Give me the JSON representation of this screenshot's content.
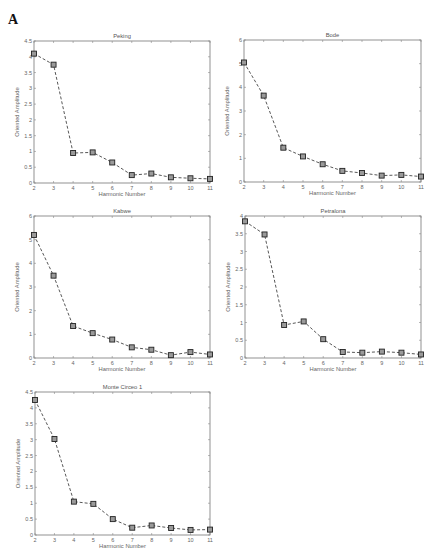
{
  "panel_label": "A",
  "chart_data": [
    {
      "type": "line",
      "title": "Peking",
      "xlabel": "Harmonic Number",
      "ylabel": "Oriented Amplitude",
      "x": [
        2,
        3,
        4,
        5,
        6,
        7,
        8,
        9,
        10,
        11
      ],
      "values": [
        4.1,
        3.75,
        0.95,
        0.97,
        0.65,
        0.25,
        0.3,
        0.18,
        0.15,
        0.13
      ],
      "ylim": [
        0,
        4.5
      ],
      "yticks": [
        0,
        0.5,
        1,
        1.5,
        2,
        2.5,
        3,
        3.5,
        4,
        4.5
      ],
      "ytick_labels": [
        "0",
        "0.5",
        "1",
        "1.5",
        "2",
        "2.5",
        "3",
        "3.5",
        "4",
        "4.5"
      ],
      "xlim": [
        2,
        11
      ],
      "grid": false,
      "box": {
        "left": 34,
        "top": 41,
        "width": 176,
        "height": 142
      }
    },
    {
      "type": "line",
      "title": "Bode",
      "xlabel": "Harmonic Number",
      "ylabel": "Oriented Amplitude",
      "x": [
        2,
        3,
        4,
        5,
        6,
        7,
        8,
        9,
        10,
        11
      ],
      "values": [
        5.05,
        3.65,
        1.45,
        1.08,
        0.75,
        0.47,
        0.38,
        0.27,
        0.3,
        0.23
      ],
      "ylim": [
        0,
        6
      ],
      "yticks": [
        0,
        1,
        2,
        3,
        4,
        5,
        6
      ],
      "ytick_labels": [
        "0",
        "1",
        "2",
        "3",
        "4",
        "5",
        "6"
      ],
      "xlim": [
        2,
        11
      ],
      "grid": false,
      "box": {
        "left": 244,
        "top": 40,
        "width": 177,
        "height": 142
      }
    },
    {
      "type": "line",
      "title": "Kabwe",
      "xlabel": "Harmonic Number",
      "ylabel": "Oriented Amplitude",
      "x": [
        2,
        3,
        4,
        5,
        6,
        7,
        8,
        9,
        10,
        11
      ],
      "values": [
        5.2,
        3.48,
        1.35,
        1.05,
        0.78,
        0.45,
        0.35,
        0.12,
        0.25,
        0.15
      ],
      "ylim": [
        0,
        6
      ],
      "yticks": [
        0,
        1,
        2,
        3,
        4,
        5,
        6
      ],
      "ytick_labels": [
        "0",
        "1",
        "2",
        "3",
        "4",
        "5",
        "6"
      ],
      "xlim": [
        2,
        11
      ],
      "grid": false,
      "box": {
        "left": 34,
        "top": 216,
        "width": 176,
        "height": 142
      }
    },
    {
      "type": "line",
      "title": "Petralona",
      "xlabel": "Harmonic Number",
      "ylabel": "Oriented Amplitude",
      "x": [
        2,
        3,
        4,
        5,
        6,
        7,
        8,
        9,
        10,
        11
      ],
      "values": [
        3.85,
        3.48,
        0.93,
        1.03,
        0.53,
        0.17,
        0.15,
        0.18,
        0.15,
        0.1
      ],
      "ylim": [
        0,
        4
      ],
      "yticks": [
        0,
        0.5,
        1,
        1.5,
        2,
        2.5,
        3,
        3.5,
        4
      ],
      "ytick_labels": [
        "0",
        "0.5",
        "1",
        "1.5",
        "2",
        "2.5",
        "3",
        "3.5",
        "4"
      ],
      "xlim": [
        2,
        11
      ],
      "grid": false,
      "box": {
        "left": 245,
        "top": 216,
        "width": 176,
        "height": 142
      }
    },
    {
      "type": "line",
      "title": "Monte Circeo 1",
      "xlabel": "Harmonic Number",
      "ylabel": "Oriented Amplitude",
      "x": [
        2,
        3,
        4,
        5,
        6,
        7,
        8,
        9,
        10,
        11
      ],
      "values": [
        4.25,
        3.02,
        1.05,
        0.98,
        0.5,
        0.23,
        0.3,
        0.22,
        0.16,
        0.17
      ],
      "ylim": [
        0,
        4.5
      ],
      "yticks": [
        0,
        0.5,
        1,
        1.5,
        2,
        2.5,
        3,
        3.5,
        4,
        4.5
      ],
      "ytick_labels": [
        "0",
        "0.5",
        "1",
        "1.5",
        "2",
        "2.5",
        "3",
        "3.5",
        "4",
        "4.5"
      ],
      "xlim": [
        2,
        11
      ],
      "grid": false,
      "box": {
        "left": 35,
        "top": 392,
        "width": 175,
        "height": 143
      }
    }
  ],
  "xtick_labels": [
    "2",
    "3",
    "4",
    "5",
    "6",
    "7",
    "8",
    "9",
    "10",
    "11"
  ]
}
